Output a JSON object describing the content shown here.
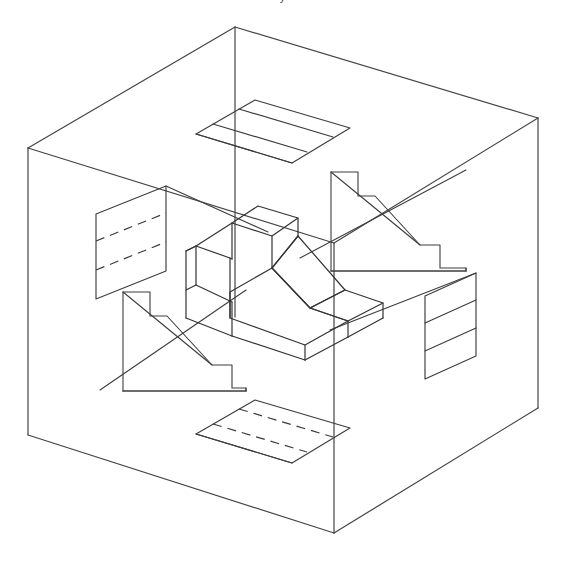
{
  "figure": {
    "background_color": "#ffffff",
    "line_color": "#3a3a3a",
    "hidden_line_color": "#3a3a3a",
    "hidden_line_style": "dashed",
    "width": 565,
    "height": 565,
    "clipped_caption_above": "y"
  },
  "glass_box": {
    "name": "transparent projection box",
    "vertices": {
      "top_rear": [
        235,
        27
      ],
      "top_left": [
        28,
        148
      ],
      "top_right": [
        538,
        118
      ],
      "top_front": [
        334,
        243
      ],
      "bottom_left": [
        28,
        435
      ],
      "bottom_right": [
        538,
        408
      ],
      "bottom_front": [
        334,
        533
      ]
    },
    "edge_count": 9,
    "visible_faces": [
      "top",
      "left",
      "right",
      "bottom",
      "rear-left",
      "rear-right"
    ]
  },
  "projection_planes": [
    {
      "id": "top-plane",
      "label": "top view projection plane",
      "corners": [
        [
          196,
          134
        ],
        [
          255,
          100
        ],
        [
          350,
          128
        ],
        [
          292,
          163
        ]
      ],
      "internal_lines": [
        {
          "style": "solid",
          "from": [
            213,
            124
          ],
          "to": [
            307,
            152
          ]
        },
        {
          "style": "solid",
          "from": [
            239,
            109
          ],
          "to": [
            333,
            137
          ]
        }
      ]
    },
    {
      "id": "left-plane",
      "label": "left side view projection plane",
      "corners": [
        [
          96,
          214
        ],
        [
          166,
          186
        ],
        [
          166,
          271
        ],
        [
          96,
          299
        ]
      ],
      "internal_lines": [
        {
          "style": "dashed",
          "from": [
            96,
            241
          ],
          "to": [
            166,
            213
          ]
        },
        {
          "style": "dashed",
          "from": [
            96,
            270
          ],
          "to": [
            166,
            242
          ]
        }
      ]
    },
    {
      "id": "right-plane",
      "label": "right side view projection plane",
      "corners": [
        [
          425,
          296
        ],
        [
          476,
          273
        ],
        [
          476,
          356
        ],
        [
          425,
          379
        ]
      ],
      "internal_lines": [
        {
          "style": "solid",
          "from": [
            425,
            323
          ],
          "to": [
            476,
            300
          ]
        },
        {
          "style": "solid",
          "from": [
            425,
            351
          ],
          "to": [
            476,
            328
          ]
        }
      ]
    },
    {
      "id": "bottom-plane",
      "label": "bottom view projection plane",
      "corners": [
        [
          196,
          434
        ],
        [
          255,
          400
        ],
        [
          350,
          428
        ],
        [
          292,
          463
        ]
      ],
      "internal_lines": [
        {
          "style": "dashed",
          "from": [
            213,
            424
          ],
          "to": [
            307,
            452
          ]
        },
        {
          "style": "dashed",
          "from": [
            239,
            409
          ],
          "to": [
            333,
            437
          ]
        }
      ]
    }
  ],
  "profile_views": [
    {
      "id": "profile-upper-right",
      "label": "auxiliary profile silhouette upper right",
      "outline": [
        [
          331,
          172
        ],
        [
          358,
          172
        ],
        [
          358,
          196
        ],
        [
          375,
          196
        ],
        [
          420,
          245
        ],
        [
          440,
          245
        ],
        [
          440,
          268
        ],
        [
          466,
          268
        ],
        [
          466,
          271
        ],
        [
          331,
          271
        ]
      ],
      "orientation": "chamfer facing down-right"
    },
    {
      "id": "profile-lower-left",
      "label": "auxiliary profile silhouette lower left",
      "outline": [
        [
          123,
          292
        ],
        [
          150,
          292
        ],
        [
          150,
          316
        ],
        [
          167,
          316
        ],
        [
          212,
          365
        ],
        [
          232,
          365
        ],
        [
          232,
          388
        ],
        [
          246,
          388
        ],
        [
          246,
          391
        ],
        [
          123,
          391
        ]
      ],
      "orientation": "chamfer facing down-right"
    }
  ],
  "object": {
    "name": "L-shaped block with chamfered face",
    "description": "isometric wireframe solid located at the center of the glass box",
    "bounding_box": [
      [
        186,
        205
      ],
      [
        398,
        360
      ]
    ],
    "features": [
      "vertical back wall",
      "horizontal base flange",
      "angled chamfer surface",
      "rectangular notch"
    ]
  },
  "projector_lines": {
    "label": "projection rays from object to planes",
    "count": 8,
    "style": "solid thin"
  }
}
